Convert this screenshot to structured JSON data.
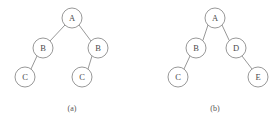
{
  "figure": {
    "width": 280,
    "height": 123,
    "background_color": "#ffffff",
    "node_stroke_color": "#8c8c8c",
    "node_fill_color": "#ffffff",
    "edge_stroke_color": "#8c8c8c",
    "label_color": "#4a4a4a",
    "caption_color": "#555555",
    "node_radius": 10
  },
  "diagram_data": {
    "type": "binary-tree-pair",
    "panels": [
      {
        "id": "panel-a",
        "caption": "(a)",
        "caption_x": 72,
        "caption_y": 108,
        "nodes": [
          {
            "id": "a-root",
            "label": "A",
            "x": 72,
            "y": 18,
            "depth": 0,
            "role": "root"
          },
          {
            "id": "a-b-left",
            "label": "B",
            "x": 43,
            "y": 48,
            "depth": 1,
            "role": "left-child"
          },
          {
            "id": "a-b-right",
            "label": "B",
            "x": 98,
            "y": 48,
            "depth": 1,
            "role": "right-child"
          },
          {
            "id": "a-c-left",
            "label": "C",
            "x": 25,
            "y": 77,
            "depth": 2,
            "role": "left-child"
          },
          {
            "id": "a-c-right",
            "label": "C",
            "x": 82,
            "y": 77,
            "depth": 2,
            "role": "left-child"
          }
        ],
        "edges": [
          {
            "from": "a-root",
            "to": "a-b-left",
            "x1": 65,
            "y1": 25,
            "x2": 50,
            "y2": 41
          },
          {
            "from": "a-root",
            "to": "a-b-right",
            "x1": 79,
            "y1": 25,
            "x2": 91,
            "y2": 41
          },
          {
            "from": "a-b-left",
            "to": "a-c-left",
            "x1": 37,
            "y1": 56,
            "x2": 31,
            "y2": 69
          },
          {
            "from": "a-b-right",
            "to": "a-c-right",
            "x1": 92,
            "y1": 56,
            "x2": 88,
            "y2": 69
          }
        ]
      },
      {
        "id": "panel-b",
        "caption": "(b)",
        "caption_x": 215,
        "caption_y": 108,
        "nodes": [
          {
            "id": "b-root",
            "label": "A",
            "x": 215,
            "y": 18,
            "depth": 0,
            "role": "root"
          },
          {
            "id": "b-b",
            "label": "B",
            "x": 196,
            "y": 48,
            "depth": 1,
            "role": "left-child"
          },
          {
            "id": "b-d",
            "label": "D",
            "x": 236,
            "y": 48,
            "depth": 1,
            "role": "right-child"
          },
          {
            "id": "b-c",
            "label": "C",
            "x": 178,
            "y": 77,
            "depth": 2,
            "role": "left-child"
          },
          {
            "id": "b-e",
            "label": "E",
            "x": 258,
            "y": 77,
            "depth": 2,
            "role": "right-child"
          }
        ],
        "edges": [
          {
            "from": "b-root",
            "to": "b-b",
            "x1": 208,
            "y1": 25,
            "x2": 203,
            "y2": 40
          },
          {
            "from": "b-root",
            "to": "b-d",
            "x1": 222,
            "y1": 25,
            "x2": 229,
            "y2": 40
          },
          {
            "from": "b-b",
            "to": "b-c",
            "x1": 190,
            "y1": 56,
            "x2": 184,
            "y2": 69
          },
          {
            "from": "b-d",
            "to": "b-e",
            "x1": 242,
            "y1": 56,
            "x2": 252,
            "y2": 69
          }
        ]
      }
    ]
  }
}
